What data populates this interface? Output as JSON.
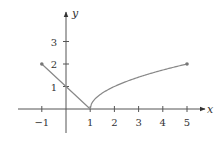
{
  "chart_data": {
    "type": "line",
    "title": "",
    "xlabel": "x",
    "ylabel": "y",
    "xlim": [
      -1.8,
      5.6
    ],
    "ylim": [
      -0.8,
      3.9
    ],
    "grid": false,
    "legend": null,
    "x_ticks": [
      -1,
      1,
      2,
      3,
      4,
      5
    ],
    "x_tick_labels": [
      "−1",
      "1",
      "2",
      "3",
      "4",
      "5"
    ],
    "y_ticks": [
      1,
      2,
      3
    ],
    "y_tick_labels": [
      "1",
      "2",
      "3"
    ],
    "series": [
      {
        "name": "linear piece",
        "description": "y = 1 - x on [-1, 1]",
        "x": [
          -1,
          0,
          1
        ],
        "y": [
          2,
          1,
          0
        ],
        "color": "#888888",
        "endpoints": [
          {
            "x": -1,
            "y": 2,
            "marker": "filled-dot"
          }
        ]
      },
      {
        "name": "root piece",
        "description": "y = sqrt(x - 1) on [1, 5]",
        "x": [
          1,
          1.25,
          1.5,
          2,
          2.5,
          3,
          3.5,
          4,
          4.5,
          5
        ],
        "y": [
          0,
          0.5,
          0.707,
          1,
          1.225,
          1.414,
          1.581,
          1.732,
          1.871,
          2
        ],
        "color": "#888888",
        "endpoints": [
          {
            "x": 5,
            "y": 2,
            "marker": "filled-dot"
          }
        ]
      }
    ],
    "colors": {
      "axis": "#555555",
      "curve": "#888888",
      "text": "#333333"
    }
  }
}
